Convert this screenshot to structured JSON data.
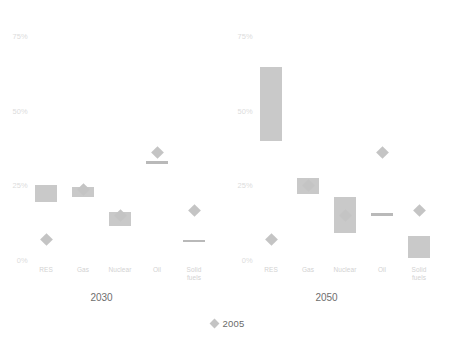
{
  "chart_data": {
    "type": "bar",
    "title": "",
    "subtitle": "",
    "xlabel": "",
    "ylabel": "",
    "ylim": [
      0,
      75
    ],
    "grid": false,
    "legend_position": "bottom",
    "y_ticks": [
      "0%",
      "25%",
      "50%",
      "75%"
    ],
    "y_tick_values": [
      0,
      25,
      50,
      75
    ],
    "categories": [
      "RES",
      "Gas",
      "Nuclear",
      "Oil",
      "Solid\nfuels"
    ],
    "legend": [
      {
        "name": "2005",
        "marker": "diamond",
        "color": "#c4c4c4"
      }
    ],
    "panels": [
      {
        "name": "2030",
        "title": "2030",
        "series": [
          {
            "name": "range",
            "type": "range-bar",
            "color": "#c9c9c9"
          },
          {
            "name": "2005",
            "type": "diamond-marker",
            "color": "#c4c4c4"
          }
        ],
        "values": [
          {
            "category": "RES",
            "range_low": 19.5,
            "range_high": 25.0,
            "marker_2005": 7.0
          },
          {
            "category": "Gas",
            "range_low": 21.0,
            "range_high": 24.5,
            "marker_2005": 23.5
          },
          {
            "category": "Nuclear",
            "range_low": 11.5,
            "range_high": 16.0,
            "marker_2005": 15.0
          },
          {
            "category": "Oil",
            "range_low": 32.0,
            "range_high": 33.0,
            "marker_2005": 36.0
          },
          {
            "category": "Solid fuels",
            "range_low": 6.0,
            "range_high": 6.8,
            "marker_2005": 16.5
          }
        ]
      },
      {
        "name": "2050",
        "title": "2050",
        "series": [
          {
            "name": "range",
            "type": "range-bar",
            "color": "#c9c9c9"
          },
          {
            "name": "2005",
            "type": "diamond-marker",
            "color": "#c4c4c4"
          }
        ],
        "values": [
          {
            "category": "RES",
            "range_low": 40.0,
            "range_high": 64.5,
            "marker_2005": 7.0
          },
          {
            "category": "Gas",
            "range_low": 22.0,
            "range_high": 27.5,
            "marker_2005": 24.8
          },
          {
            "category": "Nuclear",
            "range_low": 9.0,
            "range_high": 21.0,
            "marker_2005": 15.0
          },
          {
            "category": "Oil",
            "range_low": 15.0,
            "range_high": 15.6,
            "marker_2005": 36.0
          },
          {
            "category": "Solid fuels",
            "range_low": 0.5,
            "range_high": 8.0,
            "marker_2005": 16.5
          }
        ]
      }
    ]
  }
}
